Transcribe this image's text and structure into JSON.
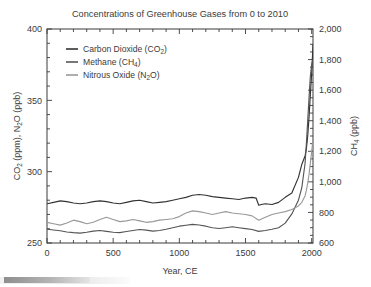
{
  "chart_data": {
    "type": "line",
    "title": "Concentrations of Greenhouse Gases from 0 to 2010",
    "xlabel": "Year, CE",
    "ylabel": "CO2 (ppm), N2O (ppb)",
    "ylabel_right": "CH4 (ppb)",
    "xlim": [
      0,
      2010
    ],
    "ylim": [
      250,
      400
    ],
    "ylim_right": [
      600,
      2000
    ],
    "xticks": [
      0,
      500,
      1000,
      1500,
      2000
    ],
    "xtick_labels": [
      "0",
      "500",
      "1000",
      "1500",
      "2000"
    ],
    "x_minor_step": 100,
    "yticks": [
      250,
      300,
      350,
      400
    ],
    "ytick_labels": [
      "250",
      "300",
      "350",
      "400"
    ],
    "y_minor_step": 10,
    "yticks_right": [
      600,
      800,
      1000,
      1200,
      1400,
      1600,
      1800,
      2000
    ],
    "ytick_labels_right": [
      "600",
      "800",
      "1,000",
      "1,200",
      "1,400",
      "1,600",
      "1,800",
      "2,000"
    ],
    "y_right_minor_step": 50,
    "grid": false,
    "legend_position": "upper-left-inside",
    "series": [
      {
        "name": "Carbon Dioxide (CO2)",
        "legend_main": "Carbon Dioxide (CO",
        "legend_sub": "2",
        "legend_tail": ")",
        "color": "#333333",
        "axis": "left",
        "x": [
          0,
          50,
          100,
          150,
          200,
          250,
          300,
          350,
          400,
          450,
          500,
          550,
          600,
          650,
          700,
          750,
          800,
          850,
          900,
          950,
          1000,
          1050,
          1100,
          1150,
          1200,
          1250,
          1300,
          1350,
          1400,
          1450,
          1500,
          1550,
          1580,
          1600,
          1620,
          1650,
          1700,
          1750,
          1800,
          1850,
          1900,
          1925,
          1950,
          1960,
          1970,
          1980,
          1990,
          2000,
          2010
        ],
        "y": [
          277.5,
          278.5,
          279.5,
          279.0,
          278.0,
          277.5,
          278.0,
          279.0,
          279.5,
          279.0,
          278.0,
          277.5,
          278.5,
          279.5,
          280.0,
          279.0,
          278.0,
          278.5,
          279.0,
          280.0,
          281.0,
          282.0,
          283.5,
          284.0,
          283.5,
          282.5,
          282.0,
          281.5,
          281.0,
          280.5,
          281.5,
          282.0,
          281.5,
          276.5,
          277.0,
          277.5,
          277.0,
          278.5,
          282.0,
          285.0,
          296.0,
          305.0,
          311.0,
          316.0,
          325.0,
          338.0,
          354.0,
          369.0,
          389.0
        ]
      },
      {
        "name": "Methane (CH4)",
        "legend_main": "Methane (CH",
        "legend_sub": "4",
        "legend_tail": ")",
        "color": "#555555",
        "axis": "right",
        "x": [
          0,
          50,
          100,
          150,
          200,
          250,
          300,
          350,
          400,
          450,
          500,
          550,
          600,
          650,
          700,
          750,
          800,
          850,
          900,
          950,
          1000,
          1050,
          1100,
          1150,
          1200,
          1250,
          1300,
          1350,
          1400,
          1450,
          1500,
          1550,
          1600,
          1650,
          1700,
          1750,
          1800,
          1850,
          1900,
          1925,
          1950,
          1960,
          1970,
          1980,
          1990,
          2000,
          2010
        ],
        "y": [
          690,
          685,
          680,
          672,
          668,
          665,
          670,
          678,
          682,
          676,
          670,
          668,
          675,
          682,
          688,
          684,
          678,
          682,
          690,
          700,
          710,
          716,
          722,
          718,
          710,
          700,
          695,
          700,
          706,
          700,
          694,
          688,
          676,
          682,
          690,
          700,
          730,
          790,
          880,
          960,
          1120,
          1250,
          1400,
          1550,
          1690,
          1770,
          1800
        ]
      },
      {
        "name": "Nitrous Oxide (N2O)",
        "legend_main": "Nitrous Oxide (N",
        "legend_sub": "2",
        "legend_tail": "O)",
        "color": "#999999",
        "axis": "left",
        "x": [
          0,
          50,
          100,
          150,
          200,
          250,
          300,
          350,
          400,
          450,
          500,
          550,
          600,
          650,
          700,
          750,
          800,
          850,
          900,
          950,
          1000,
          1050,
          1100,
          1150,
          1200,
          1250,
          1300,
          1350,
          1400,
          1450,
          1500,
          1550,
          1600,
          1650,
          1700,
          1750,
          1800,
          1850,
          1900,
          1925,
          1950,
          1960,
          1970,
          1980,
          1990,
          2000,
          2010
        ],
        "y": [
          264.5,
          263.5,
          262.5,
          264.0,
          266.0,
          265.0,
          263.5,
          264.5,
          266.5,
          268.0,
          266.5,
          265.0,
          265.5,
          266.5,
          265.5,
          264.5,
          265.0,
          266.0,
          266.5,
          267.0,
          268.5,
          271.0,
          272.5,
          272.0,
          271.0,
          270.0,
          271.0,
          272.0,
          271.0,
          270.5,
          270.0,
          269.0,
          266.0,
          268.0,
          270.0,
          271.0,
          272.0,
          273.5,
          276.0,
          278.5,
          283.0,
          287.0,
          292.0,
          298.0,
          306.0,
          314.0,
          323.0
        ]
      }
    ]
  }
}
